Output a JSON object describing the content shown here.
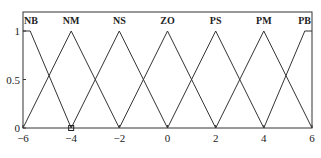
{
  "chart_data": {
    "type": "line",
    "title": "",
    "xlabel": "",
    "ylabel": "",
    "xlim": [
      -6,
      6
    ],
    "ylim": [
      0,
      1
    ],
    "grid": false,
    "x_ticks": [
      "-6",
      "-4",
      "-2",
      "0",
      "2",
      "4",
      "6"
    ],
    "x_tick_values": [
      -6,
      -4,
      -2,
      0,
      2,
      4,
      6
    ],
    "y_ticks": [
      "0",
      "0.5",
      "1"
    ],
    "y_tick_values": [
      0,
      0.5,
      1
    ],
    "series": [
      {
        "name": "NB",
        "label_x": -6,
        "points": [
          [
            -6,
            1
          ],
          [
            -5.7,
            1
          ],
          [
            -4,
            0
          ]
        ]
      },
      {
        "name": "NM",
        "label_x": -4,
        "points": [
          [
            -6,
            0
          ],
          [
            -4,
            1
          ],
          [
            -2,
            0
          ]
        ]
      },
      {
        "name": "NS",
        "label_x": -2,
        "points": [
          [
            -4,
            0
          ],
          [
            -2,
            1
          ],
          [
            0,
            0
          ]
        ]
      },
      {
        "name": "ZO",
        "label_x": 0,
        "points": [
          [
            -2,
            0
          ],
          [
            0,
            1
          ],
          [
            2,
            0
          ]
        ]
      },
      {
        "name": "PS",
        "label_x": 2,
        "points": [
          [
            0,
            0
          ],
          [
            2,
            1
          ],
          [
            4,
            0
          ]
        ]
      },
      {
        "name": "PM",
        "label_x": 4,
        "points": [
          [
            2,
            0
          ],
          [
            4,
            1
          ],
          [
            6,
            0
          ]
        ]
      },
      {
        "name": "PB",
        "label_x": 6,
        "points": [
          [
            4,
            0
          ],
          [
            5.7,
            1
          ],
          [
            6,
            1
          ]
        ]
      }
    ],
    "marker": {
      "x": -4,
      "y": 0,
      "shape": "square"
    }
  }
}
